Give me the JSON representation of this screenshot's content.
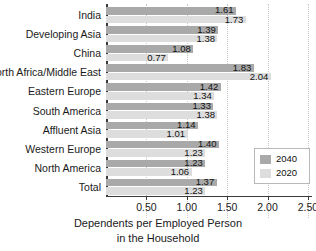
{
  "chart_data": {
    "type": "bar",
    "orientation": "horizontal",
    "title": "",
    "xlabel": "Dependents per Employed Person in the Household",
    "xlabel_line1": "Dependents per Employed Person",
    "xlabel_line2": "in the Household",
    "ylabel": "",
    "xlim": [
      0,
      2.55
    ],
    "xticks": [
      "0.50",
      "1.00",
      "1.50",
      "2.00",
      "2.50"
    ],
    "xtick_values": [
      0.5,
      1.0,
      1.5,
      2.0,
      2.5
    ],
    "grid": "vertical-dotted",
    "legend_position": "lower-right",
    "categories": [
      "India",
      "Developing Asia",
      "China",
      "North Africa/Middle East",
      "Eastern Europe",
      "South America",
      "Affluent Asia",
      "Western Europe",
      "North America",
      "Total"
    ],
    "series": [
      {
        "name": "2040",
        "color": "#a9a9a9",
        "values": [
          1.61,
          1.39,
          1.08,
          1.83,
          1.42,
          1.33,
          1.14,
          1.4,
          1.23,
          1.37
        ],
        "labels": [
          "1.61",
          "1.39",
          "1.08",
          "1.83",
          "1.42",
          "1.33",
          "1.14",
          "1.40",
          "1.23",
          "1.37"
        ]
      },
      {
        "name": "2020",
        "color": "#dddddd",
        "values": [
          1.73,
          1.38,
          0.77,
          2.04,
          1.34,
          1.38,
          1.01,
          1.23,
          1.06,
          1.23
        ],
        "labels": [
          "1.73",
          "1.38",
          "0.77",
          "2.04",
          "1.34",
          "1.38",
          "1.01",
          "1.23",
          "1.06",
          "1.23"
        ]
      }
    ]
  },
  "legend": {
    "entries": [
      {
        "label": "2040",
        "color": "#a9a9a9"
      },
      {
        "label": "2020",
        "color": "#dddddd"
      }
    ]
  }
}
